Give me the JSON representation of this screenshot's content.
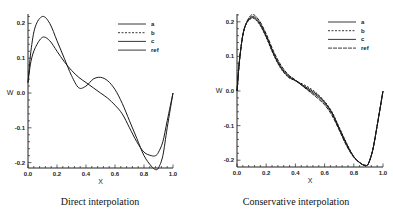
{
  "chart_data": [
    {
      "type": "line",
      "title": "Direct interpolation",
      "xlabel": "X",
      "ylabel": "W",
      "xlim": [
        0.0,
        1.0
      ],
      "ylim": [
        -0.22,
        0.22
      ],
      "x_ticks": [
        "0.0",
        "0.2",
        "0.4",
        "0.6",
        "0.8",
        "1.0"
      ],
      "y_ticks": [
        "0.2",
        "0.1",
        "0.0",
        "-0.1",
        "-0.2"
      ],
      "grid": false,
      "legend_position": "upper right",
      "legend": [
        "a",
        "b",
        "c",
        "ref"
      ],
      "x": [
        0.0,
        0.02,
        0.05,
        0.1,
        0.15,
        0.2,
        0.25,
        0.3,
        0.35,
        0.4,
        0.45,
        0.5,
        0.55,
        0.6,
        0.65,
        0.7,
        0.75,
        0.8,
        0.85,
        0.88,
        0.9,
        0.93,
        0.96,
        1.0
      ],
      "series": [
        {
          "name": "upper curve",
          "values": [
            0.03,
            0.12,
            0.19,
            0.22,
            0.2,
            0.15,
            0.1,
            0.05,
            0.015,
            0.02,
            0.04,
            0.045,
            0.035,
            0.01,
            -0.03,
            -0.08,
            -0.13,
            -0.18,
            -0.21,
            -0.22,
            -0.215,
            -0.18,
            -0.1,
            0.0
          ]
        },
        {
          "name": "lower curve",
          "values": [
            0.03,
            0.09,
            0.13,
            0.16,
            0.15,
            0.12,
            0.09,
            0.065,
            0.045,
            0.03,
            0.015,
            0.0,
            -0.015,
            -0.035,
            -0.06,
            -0.1,
            -0.14,
            -0.17,
            -0.18,
            -0.18,
            -0.17,
            -0.14,
            -0.08,
            0.0
          ]
        }
      ]
    },
    {
      "type": "line",
      "title": "Conservative interpolation",
      "xlabel": "X",
      "ylabel": "W",
      "xlim": [
        0.0,
        1.0
      ],
      "ylim": [
        -0.22,
        0.22
      ],
      "x_ticks": [
        "0.0",
        "0.2",
        "0.4",
        "0.6",
        "0.8",
        "1.0"
      ],
      "y_ticks": [
        "0.2",
        "0.1",
        "0.0",
        "-0.1",
        "-0.2"
      ],
      "grid": false,
      "legend_position": "upper right",
      "legend": [
        "a",
        "b",
        "c",
        "ref"
      ],
      "x": [
        0.0,
        0.02,
        0.05,
        0.1,
        0.15,
        0.2,
        0.25,
        0.3,
        0.35,
        0.4,
        0.45,
        0.5,
        0.55,
        0.6,
        0.65,
        0.7,
        0.75,
        0.8,
        0.85,
        0.88,
        0.9,
        0.93,
        0.96,
        1.0
      ],
      "series": [
        {
          "name": "a",
          "values": [
            0.0,
            0.1,
            0.18,
            0.215,
            0.2,
            0.16,
            0.11,
            0.07,
            0.045,
            0.03,
            0.015,
            0.0,
            -0.015,
            -0.035,
            -0.065,
            -0.11,
            -0.155,
            -0.19,
            -0.21,
            -0.215,
            -0.21,
            -0.17,
            -0.1,
            0.0
          ]
        },
        {
          "name": "b",
          "values": [
            0.0,
            0.1,
            0.18,
            0.21,
            0.195,
            0.155,
            0.105,
            0.065,
            0.04,
            0.03,
            0.02,
            0.008,
            -0.008,
            -0.03,
            -0.06,
            -0.105,
            -0.15,
            -0.19,
            -0.21,
            -0.215,
            -0.21,
            -0.17,
            -0.1,
            0.0
          ]
        },
        {
          "name": "c",
          "values": [
            0.0,
            0.1,
            0.18,
            0.212,
            0.197,
            0.157,
            0.107,
            0.067,
            0.042,
            0.03,
            0.017,
            0.004,
            -0.011,
            -0.032,
            -0.062,
            -0.107,
            -0.152,
            -0.19,
            -0.21,
            -0.215,
            -0.21,
            -0.17,
            -0.1,
            0.0
          ]
        },
        {
          "name": "ref",
          "values": [
            0.0,
            0.1,
            0.18,
            0.22,
            0.205,
            0.165,
            0.115,
            0.075,
            0.048,
            0.032,
            0.014,
            -0.003,
            -0.02,
            -0.04,
            -0.07,
            -0.113,
            -0.158,
            -0.192,
            -0.21,
            -0.215,
            -0.21,
            -0.17,
            -0.1,
            0.0
          ]
        }
      ]
    }
  ],
  "captions": {
    "left": "Direct interpolation",
    "right": "Conservative interpolation"
  }
}
